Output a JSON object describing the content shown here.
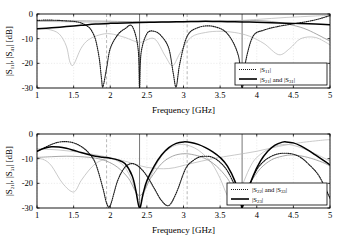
{
  "figure": {
    "background": "#ffffff",
    "frame_color": "#000000",
    "grid_color": "#cfcfcf",
    "series_colors": {
      "dark_dotted": "#1a1a1a",
      "dark_solid": "#000000",
      "light_gray": "#b8b8b8",
      "mid_gray": "#8a8a8a"
    }
  },
  "panels": [
    {
      "id": "top",
      "xlabel": "Frequency [GHz]",
      "ylabel_parts": [
        "|S",
        "11",
        "|, |S",
        "41",
        "| [dB]"
      ],
      "ylabel_text": "|S11|, |S41| [dB]",
      "xticks": [
        "1",
        "1.5",
        "2",
        "2.5",
        "3",
        "3.5",
        "4",
        "4.5",
        "5"
      ],
      "xtick_values": [
        1,
        1.5,
        2,
        2.5,
        3,
        3.5,
        4,
        4.5,
        5
      ],
      "yticks": [
        "0",
        "-10",
        "-20",
        "-30"
      ],
      "ytick_values": [
        0,
        -10,
        -20,
        -30
      ],
      "xlim": [
        1,
        5
      ],
      "ylim": [
        -30,
        0
      ],
      "legend": [
        {
          "style": "dotted",
          "label_parts": [
            "|S",
            "11",
            "|"
          ],
          "label_text": "|S11|"
        },
        {
          "style": "solid",
          "label_parts": [
            "|S",
            "21",
            "| and |S",
            "31",
            "|"
          ],
          "label_text": "|S21| and |S31|"
        }
      ],
      "markers": [
        {
          "value": 1.95,
          "style": "dashed"
        },
        {
          "value": 2.4,
          "style": "solid"
        },
        {
          "value": 3.05,
          "style": "dashed"
        },
        {
          "value": 3.8,
          "style": "solid"
        }
      ]
    },
    {
      "id": "bottom",
      "xlabel": "Frequency [GHz]",
      "ylabel_parts": [
        "|S",
        "21",
        "|, |S",
        "31",
        "| [dB]"
      ],
      "ylabel_text": "|S21|, |S31| [dB]",
      "xticks": [
        "1",
        "1.5",
        "2",
        "2.5",
        "3",
        "3.5",
        "4",
        "4.5",
        "5"
      ],
      "xtick_values": [
        1,
        1.5,
        2,
        2.5,
        3,
        3.5,
        4,
        4.5,
        5
      ],
      "yticks": [
        "0",
        "-10",
        "-20",
        "-30"
      ],
      "ytick_values": [
        0,
        -10,
        -20,
        -30
      ],
      "xlim": [
        1,
        5
      ],
      "ylim": [
        -30,
        0
      ],
      "legend": [
        {
          "style": "dotted",
          "label_parts": [
            "|S",
            "22",
            "| and |S",
            "33",
            "|"
          ],
          "label_text": "|S22| and |S33|"
        },
        {
          "style": "solid",
          "label_parts": [
            "|S",
            "23",
            "|"
          ],
          "label_text": "|S23|"
        }
      ],
      "markers": [
        {
          "value": 1.95,
          "style": "dashed"
        },
        {
          "value": 2.4,
          "style": "solid"
        },
        {
          "value": 3.05,
          "style": "dashed"
        },
        {
          "value": 3.8,
          "style": "solid"
        }
      ]
    }
  ],
  "chart_data": [
    {
      "type": "line",
      "title": "",
      "panel": "top",
      "xlabel": "Frequency [GHz]",
      "ylabel": "|S11|, |S41| [dB]",
      "xlim": [
        1,
        5
      ],
      "ylim": [
        -30,
        0
      ],
      "xticks": [
        1,
        1.5,
        2,
        2.5,
        3,
        3.5,
        4,
        4.5,
        5
      ],
      "yticks": [
        0,
        -10,
        -20,
        -30
      ],
      "grid": true,
      "legend_position": "lower-right",
      "vertical_markers": [
        1.95,
        2.4,
        3.05,
        3.8
      ],
      "series": [
        {
          "name": "|S11|",
          "style": "dotted",
          "color": "#1a1a1a",
          "x": [
            1.0,
            1.1,
            1.2,
            1.3,
            1.4,
            1.5,
            1.6,
            1.7,
            1.75,
            1.8,
            1.85,
            1.88,
            1.9,
            1.95,
            2.0,
            2.1,
            2.2,
            2.3,
            2.38,
            2.4,
            2.42,
            2.5,
            2.6,
            2.7,
            2.8,
            2.86,
            2.9,
            2.95,
            3.05,
            3.2,
            3.4,
            3.6,
            3.75,
            3.8,
            3.85,
            3.95,
            4.1,
            4.3,
            4.5,
            4.7,
            4.85,
            5.0
          ],
          "y": [
            -2.6,
            -2.5,
            -2.5,
            -2.6,
            -2.8,
            -3.0,
            -3.6,
            -5.2,
            -7.0,
            -10.5,
            -18.0,
            -26.0,
            -29.5,
            -22.0,
            -14.0,
            -8.5,
            -6.0,
            -5.0,
            -14.0,
            -30.0,
            -16.0,
            -8.0,
            -7.0,
            -9.0,
            -14.0,
            -24.0,
            -29.5,
            -20.0,
            -9.0,
            -5.5,
            -5.0,
            -8.0,
            -17.0,
            -30.0,
            -19.0,
            -9.0,
            -6.5,
            -5.0,
            -4.0,
            -3.0,
            -2.0,
            -0.6
          ]
        },
        {
          "name": "|S21| and |S31|",
          "style": "solid",
          "color": "#000000",
          "x": [
            1.0,
            1.2,
            1.4,
            1.6,
            1.8,
            2.0,
            2.2,
            2.4,
            2.6,
            2.8,
            3.0,
            3.2,
            3.4,
            3.6,
            3.8,
            4.0,
            4.2,
            4.4,
            4.6,
            4.8,
            5.0
          ],
          "y": [
            -6.0,
            -5.6,
            -5.1,
            -4.6,
            -4.1,
            -3.8,
            -3.6,
            -3.4,
            -3.3,
            -3.2,
            -3.1,
            -3.0,
            -3.0,
            -3.1,
            -3.2,
            -3.3,
            -3.5,
            -3.7,
            -3.9,
            -4.1,
            -4.4
          ]
        },
        {
          "name": "aux-gray-1",
          "style": "solid",
          "color": "#b8b8b8",
          "x": [
            1.0,
            1.15,
            1.3,
            1.4,
            1.45,
            1.5,
            1.6,
            1.7,
            1.85,
            2.0,
            2.2,
            2.4,
            2.6,
            2.75,
            2.85,
            2.95,
            3.1,
            3.3,
            3.5,
            3.7,
            3.9,
            4.1,
            4.3,
            4.45,
            4.6,
            4.8,
            5.0
          ],
          "y": [
            -6.0,
            -6.2,
            -8.0,
            -13.0,
            -19.5,
            -20.5,
            -14.0,
            -10.5,
            -8.5,
            -8.0,
            -9.5,
            -11.5,
            -10.0,
            -17.0,
            -21.0,
            -16.0,
            -9.5,
            -7.5,
            -7.0,
            -7.5,
            -9.0,
            -12.0,
            -16.5,
            -14.0,
            -10.0,
            -9.5,
            -12.5
          ]
        },
        {
          "name": "aux-gray-2",
          "style": "solid",
          "color": "#8a8a8a",
          "x": [
            1.0,
            1.3,
            1.6,
            1.9,
            2.1,
            2.3,
            2.5,
            2.7,
            2.9,
            3.1,
            3.3,
            3.5,
            3.7,
            3.9,
            4.1,
            4.3,
            4.5,
            4.7,
            5.0
          ],
          "y": [
            -2.9,
            -2.8,
            -2.8,
            -2.9,
            -3.0,
            -3.1,
            -3.2,
            -3.2,
            -3.1,
            -3.0,
            -2.9,
            -2.8,
            -2.7,
            -2.6,
            -2.8,
            -3.4,
            -4.6,
            -6.5,
            -11.0
          ]
        },
        {
          "name": "aux-gray-3",
          "style": "solid",
          "color": "#b8b8b8",
          "x": [
            1.0,
            1.5,
            2.0,
            2.4,
            2.8,
            3.2,
            3.5,
            3.8,
            4.0,
            4.2,
            4.4,
            4.6,
            4.8,
            5.0
          ],
          "y": [
            -3.0,
            -3.2,
            -3.4,
            -3.5,
            -3.4,
            -3.2,
            -3.0,
            -2.6,
            -2.2,
            -1.8,
            -1.4,
            -1.1,
            -0.8,
            -0.5
          ]
        }
      ]
    },
    {
      "type": "line",
      "title": "",
      "panel": "bottom",
      "xlabel": "Frequency [GHz]",
      "ylabel": "|S21|, |S31| [dB]",
      "xlim": [
        1,
        5
      ],
      "ylim": [
        -30,
        0
      ],
      "xticks": [
        1,
        1.5,
        2,
        2.5,
        3,
        3.5,
        4,
        4.5,
        5
      ],
      "yticks": [
        0,
        -10,
        -20,
        -30
      ],
      "grid": true,
      "legend_position": "lower-right",
      "vertical_markers": [
        1.95,
        2.4,
        3.05,
        3.8
      ],
      "series": [
        {
          "name": "|S22| and |S33|",
          "style": "dotted",
          "color": "#1a1a1a",
          "x": [
            1.0,
            1.1,
            1.2,
            1.3,
            1.4,
            1.5,
            1.6,
            1.7,
            1.8,
            1.9,
            1.95,
            2.0,
            2.1,
            2.2,
            2.3,
            2.4,
            2.5,
            2.6,
            2.7,
            2.8,
            2.9,
            3.0,
            3.05,
            3.1,
            3.2,
            3.3,
            3.4,
            3.5,
            3.6,
            3.7,
            3.8,
            3.9,
            4.0,
            4.1,
            4.2,
            4.3,
            4.4,
            4.5,
            4.6,
            4.7,
            4.85,
            5.0
          ],
          "y": [
            -7.0,
            -5.6,
            -4.2,
            -3.3,
            -3.1,
            -3.6,
            -5.0,
            -7.5,
            -12.0,
            -22.0,
            -28.0,
            -29.0,
            -19.0,
            -13.5,
            -12.0,
            -13.5,
            -17.0,
            -22.0,
            -27.0,
            -29.0,
            -24.0,
            -16.0,
            -13.0,
            -11.5,
            -9.5,
            -9.0,
            -9.5,
            -11.5,
            -15.0,
            -21.0,
            -29.0,
            -21.0,
            -14.5,
            -11.0,
            -9.0,
            -8.0,
            -7.8,
            -8.2,
            -9.5,
            -12.0,
            -17.0,
            -26.0
          ]
        },
        {
          "name": "|S23|",
          "style": "solid",
          "color": "#000000",
          "x": [
            1.0,
            1.1,
            1.2,
            1.3,
            1.4,
            1.5,
            1.6,
            1.7,
            1.8,
            1.9,
            2.0,
            2.1,
            2.2,
            2.3,
            2.35,
            2.4,
            2.45,
            2.5,
            2.6,
            2.7,
            2.8,
            2.9,
            3.0,
            3.1,
            3.2,
            3.3,
            3.4,
            3.5,
            3.6,
            3.7,
            3.78,
            3.8,
            3.85,
            3.95,
            4.05,
            4.15,
            4.25,
            4.35,
            4.4,
            4.5,
            4.6,
            4.7,
            4.8,
            4.9,
            5.0
          ],
          "y": [
            -7.0,
            -5.8,
            -5.2,
            -5.3,
            -5.8,
            -6.6,
            -7.5,
            -8.3,
            -9.0,
            -9.4,
            -9.8,
            -10.5,
            -12.0,
            -17.0,
            -23.0,
            -30.0,
            -24.0,
            -19.0,
            -13.0,
            -8.5,
            -5.5,
            -3.8,
            -3.2,
            -3.4,
            -4.2,
            -5.5,
            -7.2,
            -9.5,
            -13.0,
            -19.0,
            -27.0,
            -30.0,
            -25.0,
            -17.0,
            -11.0,
            -7.0,
            -4.5,
            -3.3,
            -3.2,
            -3.6,
            -4.8,
            -6.5,
            -8.5,
            -10.5,
            -12.5
          ]
        },
        {
          "name": "aux-gray-1",
          "style": "solid",
          "color": "#b8b8b8",
          "x": [
            1.0,
            1.1,
            1.2,
            1.35,
            1.5,
            1.6,
            1.7,
            1.8,
            1.9,
            2.0,
            2.1,
            2.2,
            2.3,
            2.4,
            2.5,
            2.6,
            2.7,
            2.8,
            2.9,
            3.0,
            3.1,
            3.2,
            3.3,
            3.4,
            3.5,
            3.6,
            3.7,
            3.8,
            3.9,
            4.0,
            4.2,
            4.4,
            4.6,
            4.8,
            5.0
          ],
          "y": [
            -9.8,
            -10.5,
            -13.0,
            -20.0,
            -23.5,
            -19.0,
            -15.0,
            -12.0,
            -10.5,
            -10.0,
            -11.0,
            -13.5,
            -19.0,
            -27.0,
            -21.0,
            -14.0,
            -9.0,
            -6.0,
            -4.5,
            -4.2,
            -5.0,
            -6.5,
            -9.0,
            -12.5,
            -18.0,
            -25.0,
            -28.0,
            -21.0,
            -14.0,
            -9.5,
            -5.5,
            -4.2,
            -5.5,
            -8.0,
            -11.0
          ]
        },
        {
          "name": "aux-gray-2",
          "style": "solid",
          "color": "#8a8a8a",
          "x": [
            1.0,
            1.2,
            1.4,
            1.6,
            1.8,
            1.95,
            2.1,
            2.25,
            2.4,
            2.55,
            2.7,
            2.85,
            3.0,
            3.15,
            3.3,
            3.45,
            3.6,
            3.75,
            3.9,
            4.05,
            4.2,
            4.35,
            4.5,
            4.7,
            4.9,
            5.0
          ],
          "y": [
            -9.5,
            -9.2,
            -9.0,
            -9.2,
            -9.8,
            -11.0,
            -13.5,
            -18.0,
            -25.0,
            -18.0,
            -12.0,
            -9.0,
            -8.0,
            -8.5,
            -10.0,
            -13.0,
            -18.0,
            -25.0,
            -20.0,
            -14.0,
            -10.5,
            -9.0,
            -8.5,
            -9.5,
            -11.5,
            -13.0
          ]
        },
        {
          "name": "aux-gray-3",
          "style": "solid",
          "color": "#b8b8b8",
          "x": [
            1.0,
            1.3,
            1.6,
            1.9,
            2.2,
            2.5,
            2.8,
            3.1,
            3.4,
            3.7,
            4.0,
            4.3,
            4.6,
            4.9,
            5.0
          ],
          "y": [
            -6.0,
            -6.5,
            -7.5,
            -9.0,
            -11.0,
            -13.5,
            -14.0,
            -12.0,
            -10.0,
            -8.5,
            -7.0,
            -5.0,
            -3.5,
            -2.5,
            -2.3
          ]
        }
      ]
    }
  ]
}
